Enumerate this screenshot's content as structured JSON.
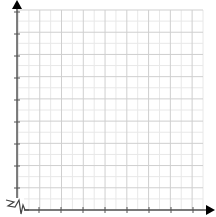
{
  "graph": {
    "title": "",
    "type": "blank coordinate grid (first quadrant)",
    "axes": {
      "x": {
        "label": "",
        "arrow": true,
        "tick_count": 8,
        "tick_labels": []
      },
      "y": {
        "label": "",
        "arrow": true,
        "tick_count": 9,
        "tick_labels": []
      }
    },
    "grid": {
      "minor_cells_x": 17,
      "minor_cells_y": 18,
      "major_every": 2
    },
    "axis_break": {
      "present": true,
      "symbol": "zigzag",
      "location": "origin"
    },
    "colors": {
      "background": "#ffffff",
      "minor_grid": "#e8e8e8",
      "major_grid": "#cfcfcf",
      "axis": "#555555",
      "arrow": "#000000"
    }
  }
}
